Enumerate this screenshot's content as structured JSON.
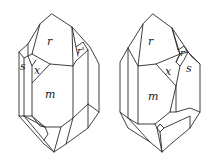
{
  "figure": {
    "left_crystal": {
      "labels": {
        "r": "r",
        "r_prime": "r'",
        "s": "s",
        "x": "x",
        "m": "m"
      }
    },
    "right_crystal": {
      "labels": {
        "r": "r",
        "r_prime": "r'",
        "s": "s",
        "x": "x",
        "m": "m"
      }
    }
  }
}
